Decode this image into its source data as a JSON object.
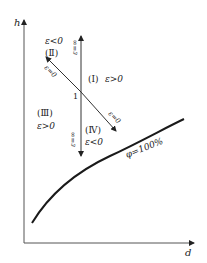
{
  "diagram": {
    "axes": {
      "y_label": "h",
      "x_label": "d"
    },
    "point_label": "1",
    "regions": [
      {
        "id": "I",
        "numeral": "(Ⅰ)",
        "condition": "ε>0"
      },
      {
        "id": "II",
        "numeral": "(Ⅱ)",
        "condition": "ε<0"
      },
      {
        "id": "III",
        "numeral": "(Ⅲ)",
        "condition": "ε>0"
      },
      {
        "id": "IV",
        "numeral": "(Ⅳ)",
        "condition": "ε<0"
      }
    ],
    "line_labels": {
      "vertical_up": "ε=∞",
      "vertical_down": "ε=∞",
      "diagonal_up": "ε=0",
      "diagonal_down": "ε=0"
    },
    "curve_label": "φ=100%",
    "colors": {
      "stroke": "#222222",
      "background": "#ffffff"
    }
  }
}
